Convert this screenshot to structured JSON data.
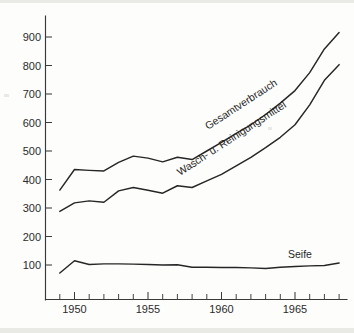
{
  "chart_data": {
    "type": "line",
    "title": "",
    "subtitle": "",
    "xlabel": "",
    "ylabel": "",
    "xlim": [
      1948.6,
      1968.5
    ],
    "ylim": [
      0,
      960
    ],
    "grid": false,
    "legend_position": "inline-labels",
    "x": [
      1949,
      1950,
      1951,
      1952,
      1953,
      1954,
      1955,
      1956,
      1957,
      1958,
      1959,
      1960,
      1961,
      1962,
      1963,
      1964,
      1965,
      1966,
      1967,
      1968
    ],
    "xticks": [
      1950,
      1955,
      1960,
      1965
    ],
    "xticklabels": [
      "1950",
      "1955",
      "1960",
      "1965"
    ],
    "xtick_minor_step": 1,
    "yticks": [
      100,
      200,
      300,
      400,
      500,
      600,
      700,
      800,
      900
    ],
    "yticklabels": [
      "100",
      "200",
      "300",
      "400",
      "500",
      "600",
      "700",
      "800",
      "900"
    ],
    "series": [
      {
        "name": "Gesamtverbrauch",
        "label": "Gesamtverbrauch",
        "values": [
          363,
          435,
          432,
          430,
          460,
          482,
          475,
          462,
          478,
          470,
          500,
          530,
          562,
          592,
          628,
          668,
          712,
          775,
          858,
          916
        ]
      },
      {
        "name": "Wasch- u. Reinigungsmittel",
        "label": "Wasch- u. Reinigungsmittel",
        "values": [
          288,
          318,
          325,
          320,
          360,
          372,
          362,
          352,
          378,
          372,
          395,
          418,
          448,
          478,
          512,
          548,
          592,
          662,
          748,
          803
        ]
      },
      {
        "name": "Seife",
        "label": "Seife",
        "values": [
          72,
          115,
          102,
          104,
          104,
          103,
          102,
          100,
          101,
          92,
          92,
          91,
          91,
          90,
          88,
          92,
          95,
          97,
          98,
          107
        ]
      }
    ],
    "annotations": [
      {
        "text": "Gesamtverbrauch",
        "x": 1960.0,
        "y": 560,
        "rotation": -33
      },
      {
        "text": "Wasch- u. Reinigungsmittel",
        "x": 1958.6,
        "y": 430,
        "rotation": -33
      },
      {
        "text": "Seife",
        "x": 1965.6,
        "y": 130,
        "rotation": 0
      }
    ]
  },
  "axes": {
    "y_tick_labels": [
      "900",
      "800",
      "700",
      "600",
      "500",
      "400",
      "300",
      "200",
      "100"
    ],
    "x_tick_labels": [
      "1950",
      "1955",
      "1960",
      "1965"
    ]
  },
  "labels": {
    "total": "Gesamtverbrauch",
    "detergent": "Wasch- u. Reinigungsmittel",
    "soap": "Seife"
  },
  "colors": {
    "line": "#262626",
    "axis": "#3a3a3a",
    "text": "#2b2b2b",
    "background": "#fdfdfc"
  }
}
